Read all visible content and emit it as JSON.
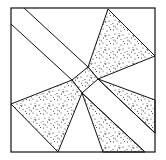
{
  "figure": {
    "stroke_color": "#111111",
    "fill_color": "#ffffff",
    "stipple_color": "#222222"
  }
}
